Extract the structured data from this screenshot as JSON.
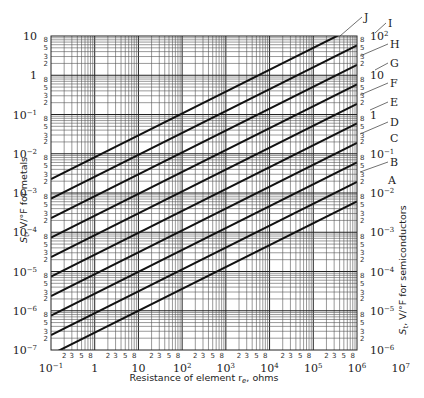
{
  "chart_data": {
    "type": "line",
    "title": "",
    "xlabel": "Resistance of element r_e, ohms",
    "ylabel_left": "S_t, V/°F for metals",
    "ylabel_right": "S_t, V/°F for semiconductors",
    "xscale": "log",
    "yscale": "log",
    "xlim": [
      0.1,
      10000000
    ],
    "ylim_left": [
      1e-07,
      10
    ],
    "ylim_right": [
      1e-06,
      100
    ],
    "grid": true,
    "x_decade_labels": [
      "10^-1",
      "1",
      "10",
      "10^2",
      "10^3",
      "10^4",
      "10^5",
      "10^6",
      "10^7"
    ],
    "x_minor_labels": [
      "2",
      "3",
      "5",
      "8"
    ],
    "y_left_decade_labels": [
      "10",
      "1",
      "10^-1",
      "10^-2",
      "10^-3",
      "10^-4",
      "10^-5",
      "10^-6",
      "10^-7"
    ],
    "y_right_decade_labels": [
      "10^2",
      "10",
      "1",
      "10^-1",
      "10^-2",
      "10^-3",
      "10^-4",
      "10^-5",
      "10^-6"
    ],
    "y_minor_labels": [
      "8",
      "5",
      "3",
      "2"
    ],
    "series": [
      {
        "name": "A",
        "slope": 0.5,
        "left_y_metals": 8e-08,
        "right_y_semiconductors": 0.0045
      },
      {
        "name": "B",
        "slope": 0.5,
        "left_y_metals": 2.5e-07,
        "right_y_semiconductors": 0.014
      },
      {
        "name": "C",
        "slope": 0.5,
        "left_y_metals": 8e-07,
        "right_y_semiconductors": 0.045
      },
      {
        "name": "D",
        "slope": 0.5,
        "left_y_metals": 2.5e-06,
        "right_y_semiconductors": 0.14
      },
      {
        "name": "E",
        "slope": 0.5,
        "left_y_metals": 8e-06,
        "right_y_semiconductors": 0.45
      },
      {
        "name": "F",
        "slope": 0.5,
        "left_y_metals": 2.5e-05,
        "right_y_semiconductors": 1.4
      },
      {
        "name": "G",
        "slope": 0.5,
        "left_y_metals": 8e-05,
        "right_y_semiconductors": 4.5
      },
      {
        "name": "H",
        "slope": 0.5,
        "left_y_metals": 0.00025,
        "right_y_semiconductors": 14
      },
      {
        "name": "I",
        "slope": 0.5,
        "left_y_metals": 0.0008,
        "right_y_semiconductors": 45
      },
      {
        "name": "J",
        "slope": 0.5,
        "left_y_metals": 0.0025,
        "right_y_semiconductors": 100
      }
    ]
  },
  "labels": {
    "xlabel": "Resistance of element r",
    "xlabel_sub": "e",
    "xlabel_tail": ", ohms",
    "ylabel_left": "S",
    "ylabel_left_sub": "t",
    "ylabel_left_tail": ", V/°F for metals",
    "ylabel_right": "S",
    "ylabel_right_sub": "t",
    "ylabel_right_tail": ", V/°F for semiconductors"
  }
}
